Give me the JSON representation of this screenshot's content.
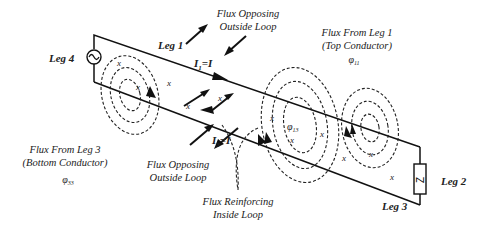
{
  "diagram": {
    "legs": {
      "leg1": "Leg 1",
      "leg2": "Leg 2",
      "leg3": "Leg 3",
      "leg4": "Leg 4"
    },
    "currents": {
      "i1": "I",
      "i1_sub": "1",
      "i1_eq": "=I",
      "i3": "I",
      "i3_sub": "3",
      "i3_eq": "=I"
    },
    "annotations": {
      "flux_opposing_top_line1": "Flux Opposing",
      "flux_opposing_top_line2": "Outside Loop",
      "flux_leg1_line1": "Flux From Leg 1",
      "flux_leg1_line2": "(Top Conductor)",
      "flux_leg1_symbol": "φ",
      "flux_leg1_sub": "11",
      "flux_leg3_line1": "Flux From Leg 3",
      "flux_leg3_line2": "(Bottom Conductor)",
      "flux_leg3_symbol": "φ",
      "flux_leg3_sub": "33",
      "flux_opposing_bottom_line1": "Flux Opposing",
      "flux_opposing_bottom_line2": "Outside Loop",
      "flux_reinforcing_line1": "Flux Reinforcing",
      "flux_reinforcing_line2": "Inside Loop",
      "flux_mid_symbol": "φ",
      "flux_mid_sub": "13"
    },
    "marks": {
      "x": "x"
    },
    "components": {
      "source_icon": "ac-source-icon",
      "load_label": "Z"
    }
  }
}
